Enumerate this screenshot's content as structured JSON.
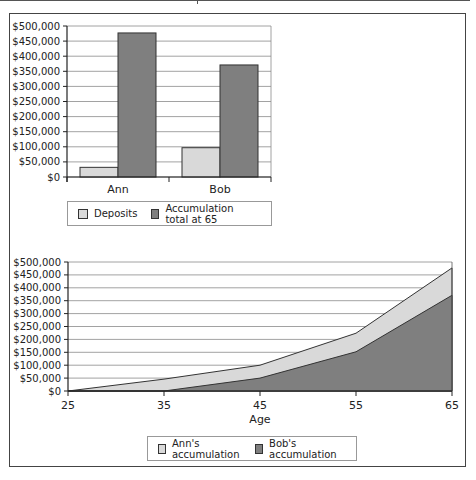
{
  "colors": {
    "light_fill": "#d9d9d9",
    "dark_fill": "#7f7f7f",
    "grid": "#8a8a8a",
    "axis": "#222222"
  },
  "chart_data": [
    {
      "type": "bar",
      "title": "",
      "xlabel": "",
      "ylabel": "",
      "categories": [
        "Ann",
        "Bob"
      ],
      "series": [
        {
          "name": "Deposits",
          "values": [
            32000,
            97000
          ]
        },
        {
          "name": "Accumulation total at 65",
          "values": [
            477000,
            371000
          ]
        }
      ],
      "ylim": [
        0,
        500000
      ],
      "yticks": [
        "$0",
        "$50,000",
        "$100,000",
        "$150,000",
        "$200,000",
        "$250,000",
        "$300,000",
        "$350,000",
        "$400,000",
        "$450,000",
        "$500,000"
      ],
      "grid": true,
      "legend_position": "bottom"
    },
    {
      "type": "area",
      "title": "",
      "xlabel": "Age",
      "ylabel": "",
      "x": [
        25,
        35,
        45,
        55,
        65
      ],
      "series": [
        {
          "name": "Ann's accumulation",
          "values": [
            0,
            46000,
            100000,
            224000,
            477000
          ]
        },
        {
          "name": "Bob's accumulation",
          "values": [
            0,
            0,
            50000,
            152000,
            371000
          ]
        }
      ],
      "ylim": [
        0,
        500000
      ],
      "yticks": [
        "$0",
        "$50,000",
        "$100,000",
        "$150,000",
        "$200,000",
        "$250,000",
        "$300,000",
        "$350,000",
        "$400,000",
        "$450,000",
        "$500,000"
      ],
      "xticks": [
        "25",
        "35",
        "45",
        "55",
        "65"
      ],
      "grid": true,
      "legend_position": "bottom"
    }
  ],
  "legend_top": {
    "items": [
      {
        "label": "Deposits",
        "swatch": "light"
      },
      {
        "label": "Accumulation total at 65",
        "swatch": "dark"
      }
    ]
  },
  "legend_bottom": {
    "items": [
      {
        "label": "Ann's accumulation",
        "swatch": "light"
      },
      {
        "label": "Bob's accumulation",
        "swatch": "dark"
      }
    ]
  }
}
